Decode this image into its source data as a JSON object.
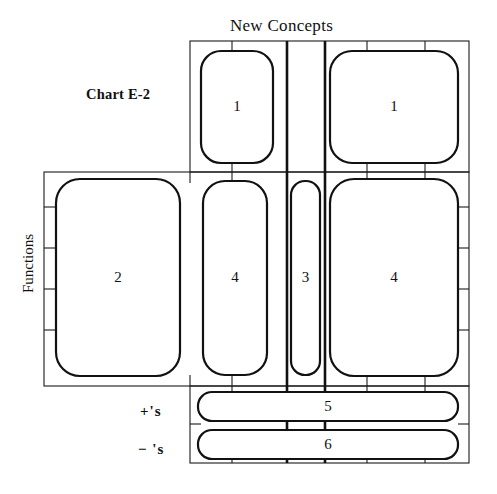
{
  "chart": {
    "id_label": "Chart E-2",
    "column_axis_title": "New Concepts",
    "row_axis_title": "Functions",
    "row_labels_bottom": [
      "+'s",
      "− 's"
    ]
  },
  "chart_data": {
    "type": "table",
    "title": "New Concepts",
    "subtitle": "Chart E-2",
    "xlabel": "New Concepts",
    "ylabel": "Functions",
    "grid": true,
    "legend": false,
    "columns": [
      {
        "index": 0,
        "x0": 44,
        "x1": 190
      },
      {
        "index": 1,
        "x0": 190,
        "x1": 232
      },
      {
        "index": 2,
        "x0": 232,
        "x1": 287
      },
      {
        "index": 3,
        "x0": 287,
        "x1": 325
      },
      {
        "index": 4,
        "x0": 325,
        "x1": 367
      },
      {
        "index": 5,
        "x0": 367,
        "x1": 425
      },
      {
        "index": 6,
        "x0": 425,
        "x1": 469
      }
    ],
    "rows": [
      {
        "index": 0,
        "y0": 41,
        "y1": 172
      },
      {
        "index": 1,
        "y0": 172,
        "y1": 207
      },
      {
        "index": 2,
        "y0": 207,
        "y1": 248
      },
      {
        "index": 3,
        "y0": 248,
        "y1": 289
      },
      {
        "index": 4,
        "y0": 289,
        "y1": 330
      },
      {
        "index": 5,
        "y0": 330,
        "y1": 386
      },
      {
        "index": 6,
        "y0": 386,
        "y1": 424
      },
      {
        "index": 7,
        "y0": 424,
        "y1": 463
      }
    ],
    "emphasis_columns_x": [
      287,
      325
    ],
    "blobs": [
      {
        "label": "1",
        "x": 201,
        "y": 51,
        "w": 72,
        "h": 112,
        "rx": 20,
        "region": "top-left-concept"
      },
      {
        "label": "1",
        "x": 330,
        "y": 51,
        "w": 128,
        "h": 112,
        "rx": 22,
        "region": "top-right-concept"
      },
      {
        "label": "2",
        "x": 56,
        "y": 179,
        "w": 124,
        "h": 197,
        "rx": 24,
        "region": "function-block-2"
      },
      {
        "label": "4",
        "x": 203,
        "y": 181,
        "w": 64,
        "h": 194,
        "rx": 22,
        "region": "function-block-4-left"
      },
      {
        "label": "3",
        "x": 291,
        "y": 181,
        "w": 29,
        "h": 194,
        "rx": 14,
        "region": "function-block-3"
      },
      {
        "label": "4",
        "x": 330,
        "y": 179,
        "w": 128,
        "h": 197,
        "rx": 24,
        "region": "function-block-4-right"
      },
      {
        "label": "5",
        "x": 198,
        "y": 392,
        "w": 260,
        "h": 29,
        "rx": 14,
        "region": "row-plus"
      },
      {
        "label": "6",
        "x": 198,
        "y": 430,
        "w": 260,
        "h": 29,
        "rx": 14,
        "region": "row-minus"
      }
    ],
    "values": [
      1,
      1,
      2,
      4,
      3,
      4,
      5,
      6
    ]
  }
}
